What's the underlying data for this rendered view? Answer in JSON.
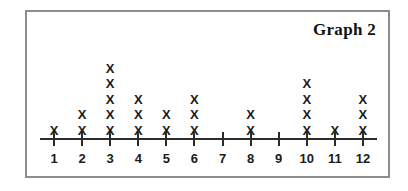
{
  "chart_data": {
    "type": "dotplot",
    "title": "Graph 2",
    "xlabel": "",
    "ylabel": "",
    "categories": [
      "1",
      "2",
      "3",
      "4",
      "5",
      "6",
      "7",
      "8",
      "9",
      "10",
      "11",
      "12"
    ],
    "values": [
      1,
      2,
      5,
      3,
      2,
      3,
      0,
      2,
      0,
      4,
      1,
      3
    ],
    "mark": "X",
    "grid": false,
    "legend": false,
    "xlim": [
      1,
      12
    ],
    "ylim": [
      0,
      5
    ],
    "total_marks": 28
  },
  "frame": {
    "border_color": "#8d8d8d",
    "background": "#ffffff"
  },
  "style": {
    "mark_color": "#1b1b1b",
    "axis_color": "#2b2b2b",
    "title_color": "#111111"
  }
}
